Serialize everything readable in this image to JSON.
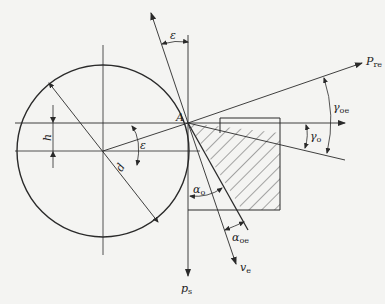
{
  "diagram": {
    "point_label": "A",
    "labels": {
      "epsilon_top": "ε",
      "epsilon_center": "ε",
      "h": "h",
      "d": "d",
      "p_re": {
        "base": "P",
        "sub": "re"
      },
      "gamma_oe": {
        "base": "γ",
        "sub": "oe"
      },
      "gamma_o": {
        "base": "γ",
        "sub": "o"
      },
      "alpha_o": {
        "base": "α",
        "sub": "o"
      },
      "alpha_oe": {
        "base": "α",
        "sub": "oe"
      },
      "v_e": {
        "base": "v",
        "sub": "e"
      },
      "p_s": {
        "base": "p",
        "sub": "s"
      }
    },
    "colors": {
      "line": "#2a2a2a",
      "background": "#f4f4f2"
    }
  }
}
